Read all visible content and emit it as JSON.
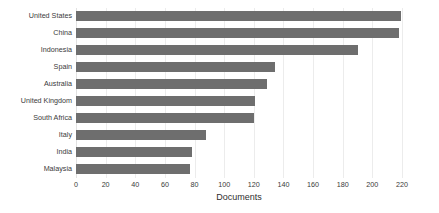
{
  "chart_data": {
    "type": "bar",
    "orientation": "horizontal",
    "title": "",
    "xlabel": "Documents",
    "ylabel": "",
    "xlim": [
      0,
      220
    ],
    "xticks": [
      0,
      20,
      40,
      60,
      80,
      100,
      120,
      140,
      160,
      180,
      200,
      220
    ],
    "grid": true,
    "grid_axis": "x",
    "legend": false,
    "bar_color": "#6e6e6e",
    "background_color": "#ffffff",
    "text_color": "#3a3a3a",
    "categories": [
      "United States",
      "China",
      "Indonesia",
      "Spain",
      "Australia",
      "United Kingdom",
      "South Africa",
      "Italy",
      "India",
      "Malaysia"
    ],
    "values": [
      219,
      218,
      190,
      134,
      129,
      121,
      120,
      88,
      78,
      77
    ]
  }
}
